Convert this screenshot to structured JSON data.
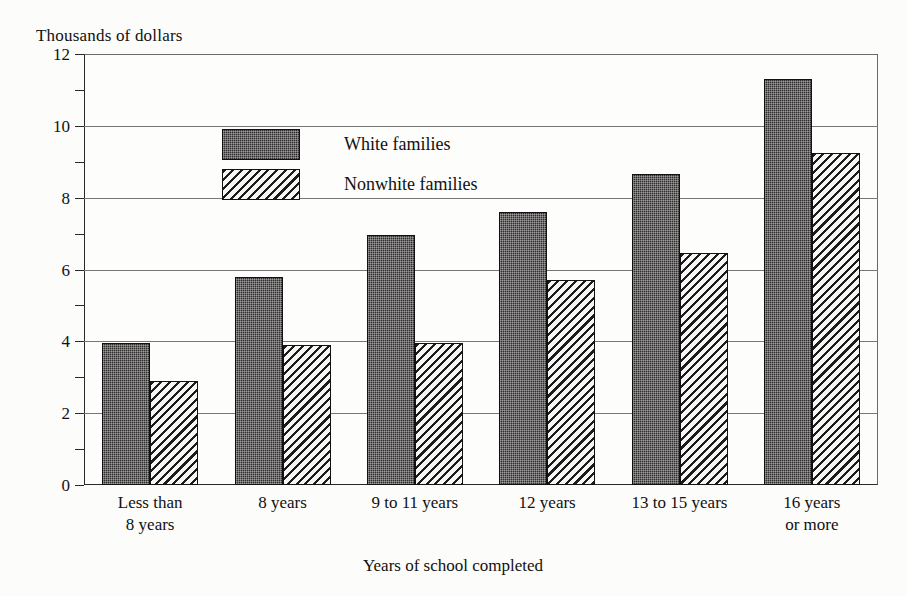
{
  "chart_data": {
    "type": "bar",
    "title": "",
    "ylabel": "Thousands of dollars",
    "xlabel": "Years of school completed",
    "ylim": [
      0,
      12
    ],
    "ytick_labels": [
      "0",
      "2",
      "4",
      "6",
      "8",
      "10",
      "12"
    ],
    "ytick_values": [
      0,
      2,
      4,
      6,
      8,
      10,
      12
    ],
    "yminor_values": [
      1,
      3,
      5,
      7,
      9,
      11
    ],
    "grid": true,
    "legend_position": "upper-left-inside",
    "categories": [
      "Less than\n8 years",
      "8 years",
      "9 to 11 years",
      "12 years",
      "13 to 15 years",
      "16 years\nor more"
    ],
    "series": [
      {
        "name": "White families",
        "fill": "stipple-dark",
        "color": "#2f2d2e",
        "values": [
          3.95,
          5.8,
          6.95,
          7.6,
          8.65,
          11.3
        ]
      },
      {
        "name": "Nonwhite families",
        "fill": "diagonal-hatch",
        "color": "#f4f4f2",
        "values": [
          2.9,
          3.9,
          3.95,
          5.7,
          6.45,
          9.25
        ]
      }
    ]
  },
  "legend": {
    "items": [
      {
        "label": "White families",
        "swatch": "white-families"
      },
      {
        "label": "Nonwhite families",
        "swatch": "nonwhite-families"
      }
    ]
  }
}
